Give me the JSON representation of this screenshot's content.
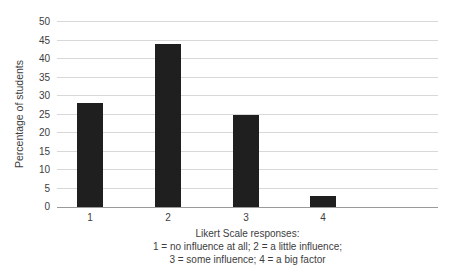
{
  "chart_data": {
    "type": "bar",
    "categories": [
      "1",
      "2",
      "3",
      "4"
    ],
    "values": [
      28,
      44,
      25,
      3
    ],
    "title": "",
    "xlabel": "Likert Scale responses: 1 = no influence at all; 2 = a little influence; 3 = some influence; 4 = a big factor",
    "ylabel": "Percentage of students",
    "ylim": [
      0,
      50
    ],
    "ytick_step": 5,
    "grid": true,
    "legend": "none",
    "bar_color": "#1f1f1f"
  },
  "axis": {
    "y_ticks": [
      "0",
      "5",
      "10",
      "15",
      "20",
      "25",
      "30",
      "35",
      "40",
      "45",
      "50"
    ]
  },
  "caption": {
    "line1": "Likert Scale responses:",
    "line2": "1 = no influence at all; 2 = a little influence;",
    "line3": "3 = some influence; 4 = a big factor"
  },
  "colors": {
    "bar": "#1f1f1f",
    "gridline": "#d8d8d8",
    "axis_line": "#9a9a9a",
    "text": "#3d3d3d",
    "background": "#ffffff"
  }
}
